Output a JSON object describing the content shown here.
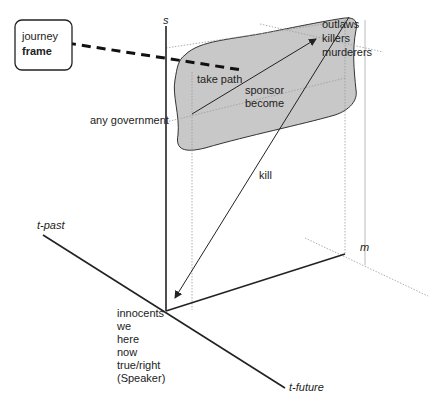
{
  "frame_box": {
    "line1": "journey",
    "line2": "frame"
  },
  "axes": {
    "s": "s",
    "m": "m",
    "t_past": "t-past",
    "t_future": "t-future"
  },
  "region_labels": {
    "target": [
      "outlaws",
      "killers",
      "murderers"
    ],
    "take_path": "take path",
    "sponsor": "sponsor",
    "become": "become",
    "any_government": "any government",
    "kill": "kill"
  },
  "origin_labels": [
    "innocents",
    "we",
    "here",
    "now",
    "true/right",
    "(Speaker)"
  ],
  "colors": {
    "region_fill": "#c8c8c8",
    "axis": "#222222",
    "guide": "#9a9a9a"
  }
}
